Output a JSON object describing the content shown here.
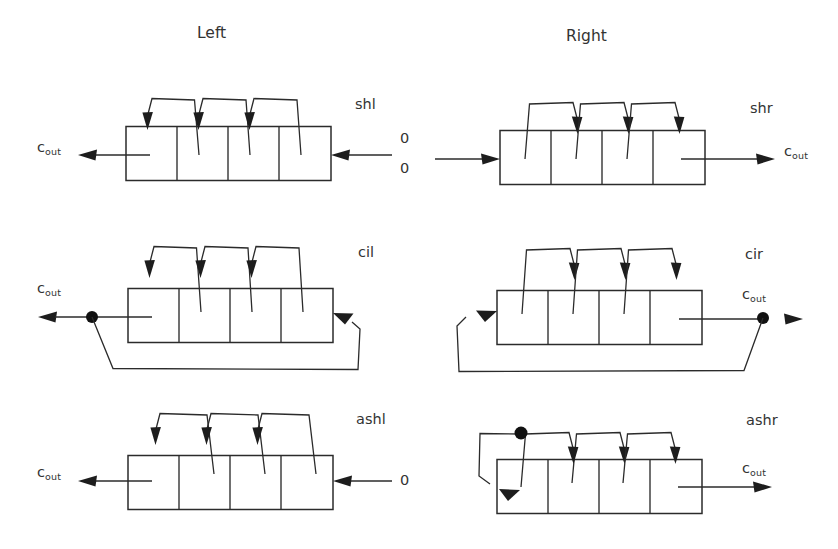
{
  "figure": {
    "type": "diagram",
    "background": "#ffffff",
    "ink_color": "#2b2b2b"
  },
  "headings": {
    "left": "Left",
    "right": "Right"
  },
  "labels": {
    "cout": "c",
    "cout_sub": "out",
    "zero": "0"
  },
  "operations": [
    {
      "id": "shl",
      "name": "shl",
      "column": "left",
      "row": 0,
      "description": "shift left: 0 shifted in at right, carry out at left",
      "cells": 4,
      "input_label": "0",
      "output_label": "c_out",
      "feedback": false,
      "junction_dot": false
    },
    {
      "id": "shr",
      "name": "shr",
      "column": "right",
      "row": 0,
      "description": "shift right: 0 shifted in at left, carry out at right",
      "cells": 4,
      "input_label": "0",
      "output_label": "c_out",
      "feedback": false,
      "junction_dot": false
    },
    {
      "id": "cil",
      "name": "cil",
      "column": "left",
      "row": 1,
      "description": "circulate left: output fed back to right end",
      "cells": 4,
      "input_label": "",
      "output_label": "c_out",
      "feedback": true,
      "junction_dot": true
    },
    {
      "id": "cir",
      "name": "cir",
      "column": "right",
      "row": 1,
      "description": "circulate right: output fed back to left end",
      "cells": 4,
      "input_label": "",
      "output_label": "c_out",
      "feedback": true,
      "junction_dot": true
    },
    {
      "id": "ashl",
      "name": "ashl",
      "column": "left",
      "row": 2,
      "description": "arithmetic shift left: 0 shifted in at right",
      "cells": 4,
      "input_label": "0",
      "output_label": "c_out",
      "feedback": false,
      "junction_dot": false
    },
    {
      "id": "ashr",
      "name": "ashr",
      "column": "right",
      "row": 2,
      "description": "arithmetic shift right: sign bit replicated back into leftmost cell",
      "cells": 4,
      "input_label": "",
      "output_label": "c_out",
      "feedback": true,
      "junction_dot": true
    }
  ]
}
